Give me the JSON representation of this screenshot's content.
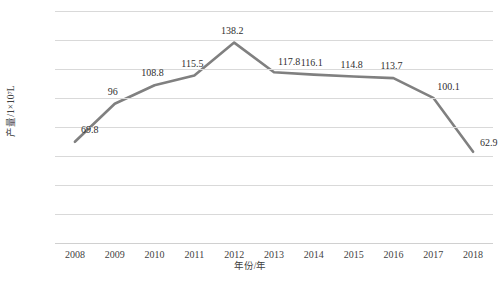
{
  "chart_data": {
    "type": "line",
    "title": "",
    "xlabel": "年份/年",
    "ylabel": "产量/1×10⁷L",
    "categories": [
      "2008",
      "2009",
      "2010",
      "2011",
      "2012",
      "2013",
      "2014",
      "2015",
      "2016",
      "2017",
      "2018"
    ],
    "values": [
      69.8,
      96,
      108.8,
      115.5,
      138.2,
      117.8,
      116.1,
      114.8,
      113.7,
      100.1,
      62.9
    ],
    "point_labels": [
      "69.8",
      "96",
      "108.8",
      "115.5",
      "138.2",
      "117.8",
      "116.1",
      "114.8",
      "113.7",
      "100.1",
      "62.9"
    ],
    "ylim": [
      0,
      160
    ],
    "y_ticks": [
      0,
      20,
      40,
      60,
      80,
      100,
      120,
      140,
      160
    ],
    "y_tick_labels": [
      "0",
      "20",
      "40",
      "60",
      "80",
      "100",
      "120",
      "140",
      "160"
    ],
    "grid": true,
    "legend": "none",
    "series": [
      {
        "name": "产量",
        "color": "#808080",
        "values": [
          69.8,
          96,
          108.8,
          115.5,
          138.2,
          117.8,
          116.1,
          114.8,
          113.7,
          100.1,
          62.9
        ]
      }
    ],
    "colors": {
      "line": "#808080",
      "gridline": "#d9d9d9",
      "text": "#3f3f3f",
      "background": "#ffffff"
    }
  }
}
